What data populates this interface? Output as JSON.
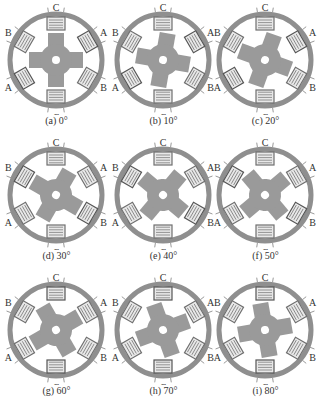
{
  "figure": {
    "pole_labels": {
      "top": "C",
      "bottom": "C",
      "upper_left": "B",
      "upper_right": "A",
      "lower_left": "A",
      "lower_right": "B"
    },
    "colors": {
      "stator": "#8f8f8f",
      "rotor": "#9a9a9a",
      "coil": "#6f6f6f",
      "energized_coil": "#555555",
      "text": "#333333"
    },
    "panels": [
      {
        "caption": "(a) 0°",
        "angle": 0,
        "energized": [
          "A"
        ]
      },
      {
        "caption": "(b) 10°",
        "angle": 10,
        "energized": [
          "A"
        ]
      },
      {
        "caption": "(c) 20°",
        "angle": 20,
        "energized": [
          "A"
        ]
      },
      {
        "caption": "(d) 30°",
        "angle": 30,
        "energized": [
          "B"
        ]
      },
      {
        "caption": "(e) 40°",
        "angle": 40,
        "energized": [
          "B"
        ]
      },
      {
        "caption": "(f) 50°",
        "angle": 50,
        "energized": [
          "B"
        ]
      },
      {
        "caption": "(g) 60°",
        "angle": 60,
        "energized": [
          "C"
        ]
      },
      {
        "caption": "(h) 70°",
        "angle": 70,
        "energized": [
          "C"
        ]
      },
      {
        "caption": "(i) 80°",
        "angle": 80,
        "energized": [
          "C"
        ]
      }
    ]
  }
}
